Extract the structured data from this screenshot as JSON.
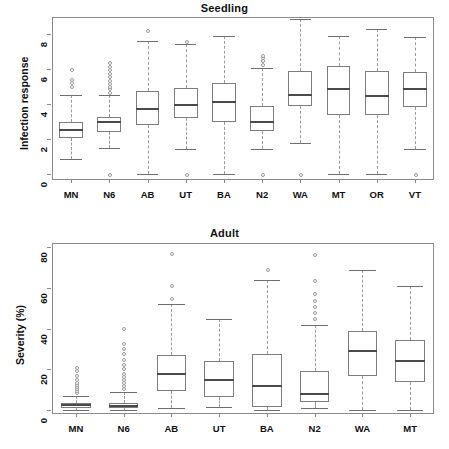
{
  "figure": {
    "background": "#ffffff",
    "box_line_color": "#7d7d7d",
    "median_color": "#4a4a4a",
    "whisker_color": "#9a9a9a"
  },
  "chart_data": [
    {
      "type": "box",
      "title": "Seedling",
      "xlabel": "",
      "ylabel": "Infection response",
      "ylim": [
        -0.35,
        9.0
      ],
      "yticks": [
        0,
        2,
        4,
        6,
        8
      ],
      "ytick_labels": [
        "0",
        "2",
        "4",
        "6",
        "8"
      ],
      "grid": false,
      "legend": "none",
      "categories": [
        "MN",
        "N6",
        "AB",
        "UT",
        "BA",
        "N2",
        "WA",
        "MT",
        "OR",
        "VT"
      ],
      "boxes": [
        {
          "label": "MN",
          "whisker_low": 0.85,
          "q1": 2.05,
          "median": 2.5,
          "q3": 2.95,
          "whisker_high": 4.5,
          "outliers": [
            5.05,
            5.25,
            5.45,
            6.0
          ]
        },
        {
          "label": "N6",
          "whisker_low": 1.5,
          "q1": 2.4,
          "median": 3.0,
          "q3": 3.25,
          "whisker_high": 4.5,
          "outliers": [
            4.7,
            4.9,
            5.05,
            5.2,
            5.4,
            5.6,
            5.8,
            6.0,
            6.2,
            6.4,
            0.0
          ]
        },
        {
          "label": "AB",
          "whisker_low": 0.0,
          "q1": 2.8,
          "median": 3.75,
          "q3": 4.75,
          "whisker_high": 7.6,
          "outliers": [
            8.25
          ]
        },
        {
          "label": "UT",
          "whisker_low": 1.45,
          "q1": 3.2,
          "median": 3.95,
          "q3": 4.95,
          "whisker_high": 7.45,
          "outliers": [
            7.6,
            0.0
          ]
        },
        {
          "label": "BA",
          "whisker_low": 0.0,
          "q1": 2.95,
          "median": 4.15,
          "q3": 5.2,
          "whisker_high": 7.9,
          "outliers": []
        },
        {
          "label": "N2",
          "whisker_low": 1.45,
          "q1": 2.45,
          "median": 2.95,
          "q3": 3.9,
          "whisker_high": 6.1,
          "outliers": [
            6.3,
            6.5,
            6.55,
            6.7,
            6.8,
            0.0
          ]
        },
        {
          "label": "WA",
          "whisker_low": 1.75,
          "q1": 3.9,
          "median": 4.55,
          "q3": 5.9,
          "whisker_high": 8.9,
          "outliers": [
            0.0
          ]
        },
        {
          "label": "MT",
          "whisker_low": 0.0,
          "q1": 3.4,
          "median": 4.85,
          "q3": 6.2,
          "whisker_high": 7.9,
          "outliers": []
        },
        {
          "label": "OR",
          "whisker_low": 0.0,
          "q1": 3.4,
          "median": 4.45,
          "q3": 5.9,
          "whisker_high": 8.3,
          "outliers": []
        },
        {
          "label": "VT",
          "whisker_low": 1.4,
          "q1": 3.85,
          "median": 4.85,
          "q3": 5.85,
          "whisker_high": 7.85,
          "outliers": [
            0.0
          ]
        }
      ]
    },
    {
      "type": "box",
      "title": "Adult",
      "xlabel": "",
      "ylabel": "Severity (%)",
      "ylim": [
        -2.0,
        82.0
      ],
      "yticks": [
        0,
        20,
        40,
        60,
        80
      ],
      "ytick_labels": [
        "0",
        "20",
        "40",
        "60",
        "80"
      ],
      "grid": false,
      "legend": "none",
      "categories": [
        "MN",
        "N6",
        "AB",
        "UT",
        "BA",
        "N2",
        "WA",
        "MT"
      ],
      "boxes": [
        {
          "label": "MN",
          "whisker_low": 0.0,
          "q1": 1.0,
          "median": 2.2,
          "q3": 3.6,
          "whisker_high": 7.0,
          "outliers": [
            8.5,
            9.5,
            10.5,
            11.5,
            12.5,
            13.5,
            15.0,
            17.0,
            19.5,
            21.0
          ]
        },
        {
          "label": "N6",
          "whisker_low": 0.0,
          "q1": 0.8,
          "median": 1.9,
          "q3": 3.2,
          "whisker_high": 9.0,
          "outliers": [
            10.5,
            12.0,
            13.5,
            15.0,
            16.5,
            18.0,
            20.5,
            22.5,
            25.0,
            28.0,
            30.5,
            33.0,
            40.0
          ]
        },
        {
          "label": "AB",
          "whisker_low": 0.8,
          "q1": 9.2,
          "median": 17.5,
          "q3": 27.0,
          "whisker_high": 52.0,
          "outliers": [
            55.0,
            61.5,
            77.0
          ]
        },
        {
          "label": "UT",
          "whisker_low": 1.6,
          "q1": 6.2,
          "median": 14.5,
          "q3": 24.2,
          "whisker_high": 44.5,
          "outliers": []
        },
        {
          "label": "BA",
          "whisker_low": 0.0,
          "q1": 1.4,
          "median": 12.0,
          "q3": 27.4,
          "whisker_high": 64.0,
          "outliers": [
            69.0
          ]
        },
        {
          "label": "N2",
          "whisker_low": 0.8,
          "q1": 4.0,
          "median": 7.6,
          "q3": 19.2,
          "whisker_high": 41.5,
          "outliers": [
            45.0,
            48.0,
            51.0,
            54.0,
            57.5,
            63.5,
            76.5
          ]
        },
        {
          "label": "WA",
          "whisker_low": 0.2,
          "q1": 16.5,
          "median": 29.0,
          "q3": 39.0,
          "whisker_high": 68.5,
          "outliers": []
        },
        {
          "label": "MT",
          "whisker_low": 0.0,
          "q1": 13.6,
          "median": 24.0,
          "q3": 34.2,
          "whisker_high": 61.0,
          "outliers": []
        }
      ]
    }
  ]
}
